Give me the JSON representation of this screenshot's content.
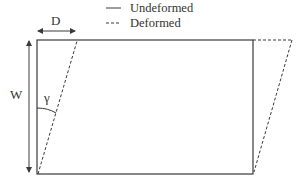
{
  "legend": {
    "items": [
      {
        "label": "Undeformed",
        "style": "solid"
      },
      {
        "label": "Deformed",
        "style": "dashed"
      }
    ]
  },
  "labels": {
    "width_dimension": "D",
    "height_dimension": "W",
    "shear_angle": "γ"
  },
  "colors": {
    "line": "#3a3a3a",
    "text": "#333333",
    "background": "#ffffff"
  }
}
